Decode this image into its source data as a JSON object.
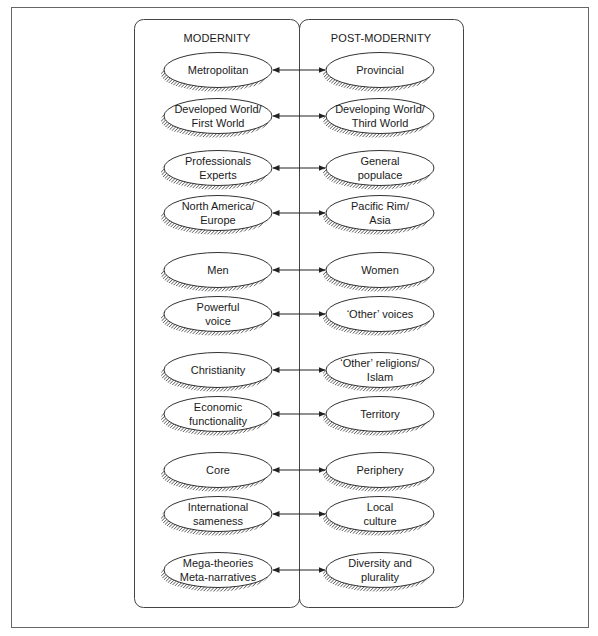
{
  "columns": {
    "left": {
      "heading": "MODERNITY"
    },
    "right": {
      "heading": "POST-MODERNITY"
    }
  },
  "pairs": [
    {
      "left": [
        "Metropolitan"
      ],
      "right": [
        "Provincial"
      ]
    },
    {
      "left": [
        "Developed World/",
        "First World"
      ],
      "right": [
        "Developing World/",
        "Third World"
      ]
    },
    {
      "left": [
        "Professionals",
        "Experts"
      ],
      "right": [
        "General",
        "populace"
      ]
    },
    {
      "left": [
        "North America/",
        "Europe"
      ],
      "right": [
        "Pacific Rim/",
        "Asia"
      ]
    },
    {
      "left": [
        "Men"
      ],
      "right": [
        "Women"
      ]
    },
    {
      "left": [
        "Powerful",
        "voice"
      ],
      "right": [
        "‘Other’ voices"
      ]
    },
    {
      "left": [
        "Christianity"
      ],
      "right": [
        "‘Other’ religions/",
        "Islam"
      ]
    },
    {
      "left": [
        "Economic",
        "functionality"
      ],
      "right": [
        "Territory"
      ]
    },
    {
      "left": [
        "Core"
      ],
      "right": [
        "Periphery"
      ]
    },
    {
      "left": [
        "International",
        "sameness"
      ],
      "right": [
        "Local",
        "culture"
      ]
    },
    {
      "left": [
        "Mega-theories",
        "Meta-narratives"
      ],
      "right": [
        "Diversity and",
        "plurality"
      ]
    }
  ],
  "connector": "bidirectional-arrow",
  "colors": {
    "stroke": "#333333",
    "background": "#ffffff",
    "frame": "#555555"
  }
}
